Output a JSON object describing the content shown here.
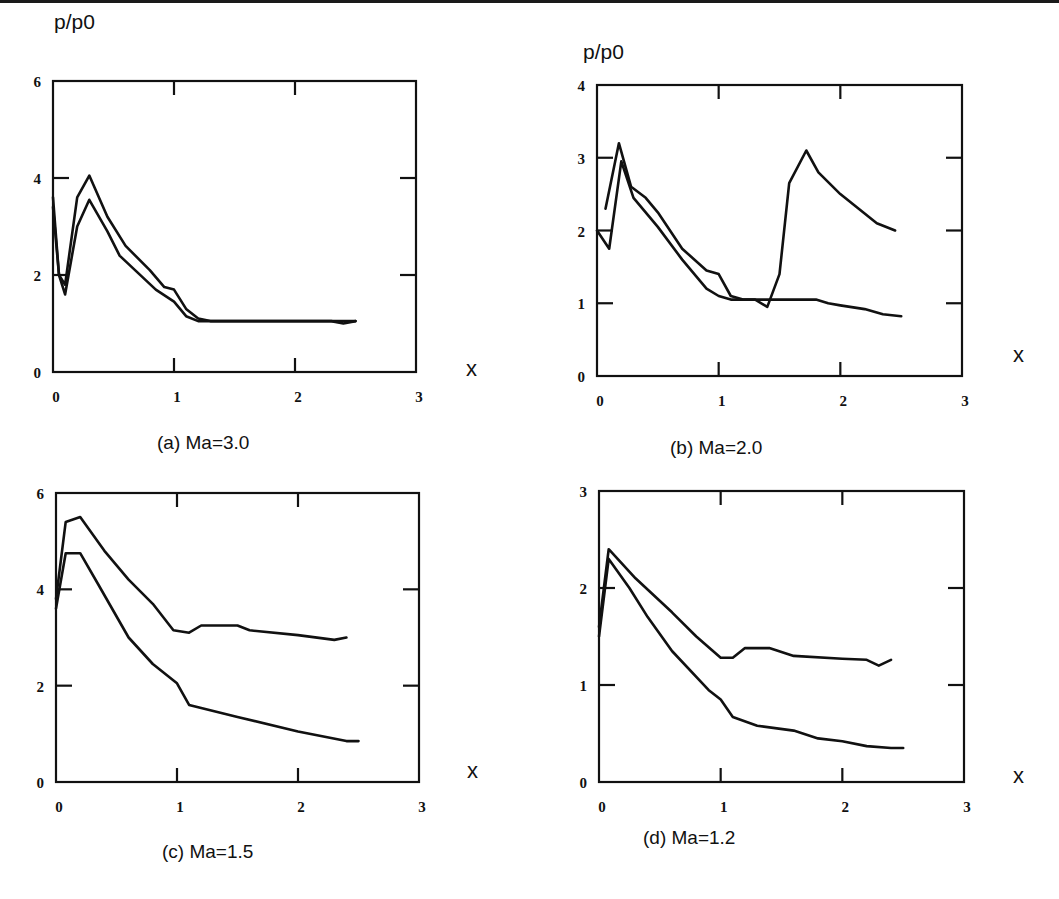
{
  "figure": {
    "ylabel": "p/p0",
    "xlabel": "x"
  },
  "chart_data": [
    {
      "id": "a",
      "type": "line",
      "title": "(a) Ma=3.0",
      "xlabel": "x",
      "ylabel": "p/p0",
      "xlim": [
        0,
        3
      ],
      "ylim": [
        0,
        6
      ],
      "xticks": [
        0,
        1,
        2,
        3
      ],
      "yticks": [
        0,
        2,
        4,
        6
      ],
      "grid": false,
      "legend": null,
      "series": [
        {
          "name": "curve-1",
          "points": [
            [
              0,
              3.6
            ],
            [
              0.05,
              2.0
            ],
            [
              0.1,
              1.8
            ],
            [
              0.2,
              3.6
            ],
            [
              0.3,
              4.05
            ],
            [
              0.45,
              3.2
            ],
            [
              0.6,
              2.6
            ],
            [
              0.8,
              2.1
            ],
            [
              0.92,
              1.75
            ],
            [
              1.0,
              1.7
            ],
            [
              1.1,
              1.3
            ],
            [
              1.2,
              1.1
            ],
            [
              1.3,
              1.05
            ],
            [
              2.5,
              1.05
            ]
          ]
        },
        {
          "name": "curve-2",
          "points": [
            [
              0,
              3.4
            ],
            [
              0.05,
              2.0
            ],
            [
              0.1,
              1.6
            ],
            [
              0.2,
              3.0
            ],
            [
              0.3,
              3.55
            ],
            [
              0.45,
              2.9
            ],
            [
              0.55,
              2.4
            ],
            [
              0.7,
              2.05
            ],
            [
              0.85,
              1.7
            ],
            [
              1.0,
              1.45
            ],
            [
              1.1,
              1.15
            ],
            [
              1.2,
              1.05
            ],
            [
              2.3,
              1.05
            ],
            [
              2.4,
              1.0
            ],
            [
              2.5,
              1.05
            ]
          ]
        }
      ]
    },
    {
      "id": "b",
      "type": "line",
      "title": "(b) Ma=2.0",
      "xlabel": "x",
      "ylabel": "p/p0",
      "xlim": [
        0,
        3
      ],
      "ylim": [
        0,
        4
      ],
      "xticks": [
        0,
        1,
        2,
        3
      ],
      "yticks": [
        0,
        1,
        2,
        3,
        4
      ],
      "grid": false,
      "legend": null,
      "series": [
        {
          "name": "curve-1",
          "points": [
            [
              0.07,
              2.3
            ],
            [
              0.18,
              3.2
            ],
            [
              0.28,
              2.6
            ],
            [
              0.4,
              2.45
            ],
            [
              0.5,
              2.25
            ],
            [
              0.7,
              1.75
            ],
            [
              0.9,
              1.45
            ],
            [
              1.0,
              1.4
            ],
            [
              1.1,
              1.1
            ],
            [
              1.2,
              1.05
            ],
            [
              1.3,
              1.05
            ],
            [
              1.4,
              0.95
            ],
            [
              1.5,
              1.4
            ],
            [
              1.58,
              2.65
            ],
            [
              1.72,
              3.1
            ],
            [
              1.82,
              2.8
            ],
            [
              2.0,
              2.5
            ],
            [
              2.3,
              2.1
            ],
            [
              2.45,
              2.0
            ]
          ]
        },
        {
          "name": "curve-2",
          "points": [
            [
              0,
              2.0
            ],
            [
              0.1,
              1.75
            ],
            [
              0.2,
              2.95
            ],
            [
              0.3,
              2.45
            ],
            [
              0.5,
              2.05
            ],
            [
              0.7,
              1.6
            ],
            [
              0.9,
              1.2
            ],
            [
              1.0,
              1.1
            ],
            [
              1.1,
              1.05
            ],
            [
              1.3,
              1.05
            ],
            [
              1.8,
              1.05
            ],
            [
              1.9,
              1.0
            ],
            [
              2.0,
              0.97
            ],
            [
              2.2,
              0.92
            ],
            [
              2.35,
              0.85
            ],
            [
              2.5,
              0.82
            ]
          ]
        }
      ]
    },
    {
      "id": "c",
      "type": "line",
      "title": "(c) Ma=1.5",
      "xlabel": "x",
      "ylabel": "p/p0",
      "xlim": [
        0,
        3
      ],
      "ylim": [
        0,
        6
      ],
      "xticks": [
        0,
        1,
        2,
        3
      ],
      "yticks": [
        0,
        2,
        4,
        6
      ],
      "grid": false,
      "legend": null,
      "series": [
        {
          "name": "curve-1",
          "points": [
            [
              0,
              3.8
            ],
            [
              0.08,
              5.4
            ],
            [
              0.2,
              5.5
            ],
            [
              0.4,
              4.8
            ],
            [
              0.6,
              4.2
            ],
            [
              0.8,
              3.7
            ],
            [
              0.97,
              3.15
            ],
            [
              1.1,
              3.1
            ],
            [
              1.2,
              3.25
            ],
            [
              1.5,
              3.25
            ],
            [
              1.6,
              3.15
            ],
            [
              2.0,
              3.05
            ],
            [
              2.3,
              2.95
            ],
            [
              2.4,
              3.0
            ]
          ]
        },
        {
          "name": "curve-2",
          "points": [
            [
              0,
              3.6
            ],
            [
              0.08,
              4.75
            ],
            [
              0.2,
              4.75
            ],
            [
              0.35,
              4.1
            ],
            [
              0.6,
              3.0
            ],
            [
              0.8,
              2.45
            ],
            [
              1.0,
              2.05
            ],
            [
              1.1,
              1.6
            ],
            [
              1.5,
              1.35
            ],
            [
              2.0,
              1.05
            ],
            [
              2.4,
              0.85
            ],
            [
              2.5,
              0.85
            ]
          ]
        }
      ]
    },
    {
      "id": "d",
      "type": "line",
      "title": "(d) Ma=1.2",
      "xlabel": "x",
      "ylabel": "p/p0",
      "xlim": [
        0,
        3
      ],
      "ylim": [
        0,
        3
      ],
      "xticks": [
        0,
        1,
        2,
        3
      ],
      "yticks": [
        0,
        1,
        2,
        3
      ],
      "grid": false,
      "legend": null,
      "series": [
        {
          "name": "curve-1",
          "points": [
            [
              0,
              1.6
            ],
            [
              0.08,
              2.4
            ],
            [
              0.3,
              2.1
            ],
            [
              0.6,
              1.75
            ],
            [
              0.8,
              1.5
            ],
            [
              1.0,
              1.28
            ],
            [
              1.1,
              1.28
            ],
            [
              1.2,
              1.38
            ],
            [
              1.4,
              1.38
            ],
            [
              1.6,
              1.3
            ],
            [
              2.0,
              1.27
            ],
            [
              2.2,
              1.26
            ],
            [
              2.3,
              1.2
            ],
            [
              2.4,
              1.26
            ]
          ]
        },
        {
          "name": "curve-2",
          "points": [
            [
              0,
              1.5
            ],
            [
              0.08,
              2.3
            ],
            [
              0.25,
              2.0
            ],
            [
              0.4,
              1.7
            ],
            [
              0.6,
              1.35
            ],
            [
              0.9,
              0.95
            ],
            [
              1.0,
              0.85
            ],
            [
              1.1,
              0.67
            ],
            [
              1.3,
              0.58
            ],
            [
              1.6,
              0.53
            ],
            [
              1.8,
              0.45
            ],
            [
              2.0,
              0.42
            ],
            [
              2.2,
              0.37
            ],
            [
              2.4,
              0.35
            ],
            [
              2.5,
              0.35
            ]
          ]
        }
      ]
    }
  ]
}
